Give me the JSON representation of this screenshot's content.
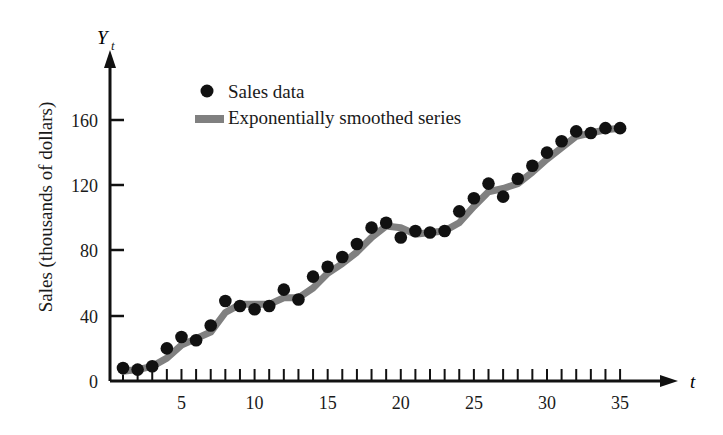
{
  "chart_data": {
    "type": "line",
    "title": "",
    "xlabel": "t",
    "ylabel": "Sales (thousands of dollars)",
    "yaxis_symbol": "Y",
    "yaxis_subscript": "t",
    "xlim": [
      0,
      36
    ],
    "ylim": [
      0,
      180
    ],
    "grid": false,
    "legend_position": "top-left-inside",
    "x_tick_labels": [
      "5",
      "10",
      "15",
      "20",
      "25",
      "30",
      "35"
    ],
    "x_tick_values": [
      5,
      10,
      15,
      20,
      25,
      30,
      35
    ],
    "x_minor_ticks_every": 1,
    "y_tick_labels": [
      "0",
      "40",
      "80",
      "120",
      "160"
    ],
    "y_tick_values": [
      0,
      40,
      80,
      120,
      160
    ],
    "x": [
      1,
      2,
      3,
      4,
      5,
      6,
      7,
      8,
      9,
      10,
      11,
      12,
      13,
      14,
      15,
      16,
      17,
      18,
      19,
      20,
      21,
      22,
      23,
      24,
      25,
      26,
      27,
      28,
      29,
      30,
      31,
      32,
      33,
      34,
      35
    ],
    "series": [
      {
        "name": "Sales data",
        "style": "points",
        "color": "#111111",
        "values": [
          8,
          7,
          9,
          20,
          27,
          25,
          34,
          49,
          46,
          44,
          46,
          56,
          50,
          64,
          70,
          76,
          84,
          94,
          97,
          88,
          92,
          91,
          92,
          104,
          112,
          121,
          113,
          124,
          132,
          140,
          147,
          153,
          152,
          155,
          155
        ]
      },
      {
        "name": "Exponentially smoothed series",
        "style": "line",
        "color": "#808080",
        "values": [
          6,
          7,
          9,
          14,
          22,
          26,
          30,
          42,
          47,
          47,
          47,
          51,
          51,
          57,
          66,
          72,
          79,
          88,
          95,
          94,
          90,
          91,
          92,
          97,
          107,
          116,
          118,
          121,
          128,
          136,
          143,
          150,
          152,
          154,
          155
        ]
      }
    ],
    "legend": [
      {
        "label": "Sales data",
        "marker": "dot",
        "color": "#111111"
      },
      {
        "label": "Exponentially smoothed series",
        "marker": "line",
        "color": "#808080"
      }
    ]
  }
}
